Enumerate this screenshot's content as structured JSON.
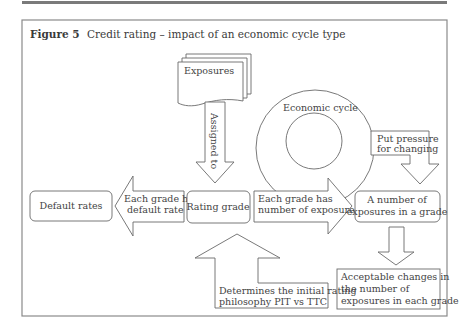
{
  "figure": {
    "number_label": "Figure 5",
    "title": "Credit rating – impact of an economic cycle type"
  },
  "nodes": {
    "exposures": "Exposures",
    "economic_cycle": "Economic cycle",
    "rating_grade": "Rating grade",
    "default_rates": "Default rates",
    "number_of_exposures": {
      "line1": "A number of",
      "line2": "exposures in a grade"
    },
    "acceptable_changes": {
      "line1": "Acceptable changes in",
      "line2": "the number of",
      "line3": "exposures in each grade"
    }
  },
  "arrows": {
    "assigned_to": "Assigned to",
    "each_grade_default": {
      "line1": "Each grade has",
      "line2": "default rate"
    },
    "each_grade_exposures": {
      "line1": "Each grade has",
      "line2": "number of exposures"
    },
    "put_pressure": {
      "line1": "Put pressure",
      "line2": "for changing"
    },
    "determines": {
      "line1": "Determines the initial rating",
      "line2": "philosophy PIT vs TTC"
    }
  },
  "colors": {
    "stroke": "#6a6a6a",
    "frame": "#8a8a8a",
    "text": "#444444",
    "top_rule": "#7a7a7a"
  }
}
